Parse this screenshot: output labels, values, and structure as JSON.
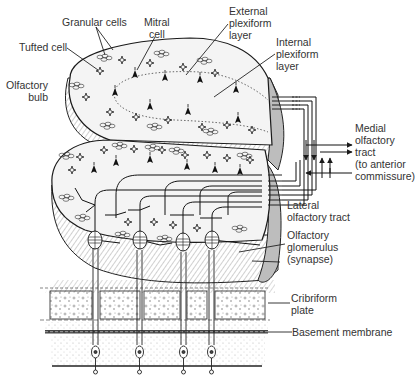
{
  "labels": {
    "granular_cells": "Granular cells",
    "mitral_cell": "Mitral\ncell",
    "tufted_cell": "Tufted cell",
    "olfactory_bulb": "Olfactory\nbulb",
    "external_plexiform": "External\nplexiform\nlayer",
    "internal_plexiform": "Internal\nplexiform\nlayer",
    "medial_tract": "Medial\nolfactory\ntract\n(to anterior\ncommissure)",
    "lateral_tract": "Lateral\nolfactory tract",
    "glomerulus": "Olfactory\nglomerulus\n(synapse)",
    "cribriform": "Cribriform\nplate",
    "basement": "Basement membrane"
  },
  "colors": {
    "line": "#1a1a1a",
    "bulb_fill": "#f4f4f4",
    "side_fill": "#bdbdbd",
    "hatch": "#8a8a8a",
    "text": "#333333"
  }
}
